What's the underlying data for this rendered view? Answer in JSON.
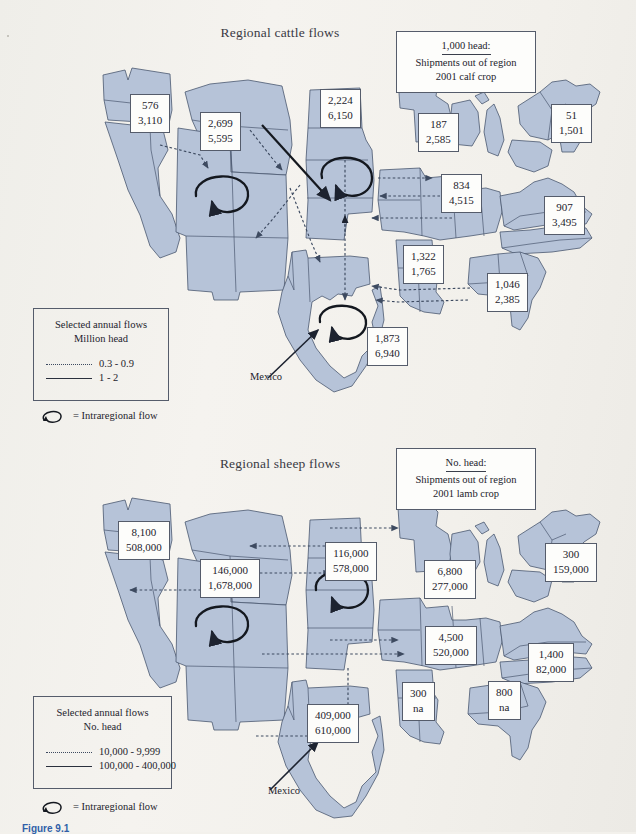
{
  "figure": {
    "caption": "Figure 9.1",
    "background_color": "#f2f0eb",
    "region_fill_color": "#b6c3d8",
    "region_stroke_color": "#4a5870"
  },
  "cattle_map": {
    "title": "Regional cattle flows",
    "note": {
      "head_line": "1,000 head:",
      "line2": "Shipments out of region",
      "line3": "2001 calf crop"
    },
    "mexico_label": "Mexico",
    "legend": {
      "title_line1": "Selected annual flows",
      "title_line2": "Million head",
      "rows": [
        {
          "style": "dotted",
          "label": "0.3 - 0.9"
        },
        {
          "style": "solid",
          "label": "1 - 2"
        }
      ],
      "intraregional_label": "= Intraregional flow"
    },
    "labels": [
      {
        "region": "pacific-northwest",
        "v1": "576",
        "v2": "3,110"
      },
      {
        "region": "northern-rockies",
        "v1": "2,699",
        "v2": "5,595"
      },
      {
        "region": "northern-plains",
        "v1": "2,224",
        "v2": "6,150"
      },
      {
        "region": "upper-midwest",
        "v1": "187",
        "v2": "2,585"
      },
      {
        "region": "northeast",
        "v1": "51",
        "v2": "1,501"
      },
      {
        "region": "corn-belt",
        "v1": "834",
        "v2": "4,515"
      },
      {
        "region": "appalachia",
        "v1": "907",
        "v2": "3,495"
      },
      {
        "region": "delta-states",
        "v1": "1,322",
        "v2": "1,765"
      },
      {
        "region": "southeast",
        "v1": "1,046",
        "v2": "2,385"
      },
      {
        "region": "southern-plains",
        "v1": "1,873",
        "v2": "6,940"
      }
    ]
  },
  "sheep_map": {
    "title": "Regional sheep flows",
    "note": {
      "head_line": "No. head:",
      "line2": "Shipments out of region",
      "line3": "2001 lamb crop"
    },
    "mexico_label": "Mexico",
    "legend": {
      "title_line1": "Selected annual flows",
      "title_line2": "No. head",
      "rows": [
        {
          "style": "dotted",
          "label": "10,000 - 9,999"
        },
        {
          "style": "solid",
          "label": "100,000 - 400,000"
        }
      ],
      "intraregional_label": "= Intraregional flow"
    },
    "labels": [
      {
        "region": "pacific-northwest",
        "v1": "8,100",
        "v2": "508,000"
      },
      {
        "region": "northern-rockies",
        "v1": "146,000",
        "v2": "1,678,000"
      },
      {
        "region": "northern-plains",
        "v1": "116,000",
        "v2": "578,000"
      },
      {
        "region": "upper-midwest",
        "v1": "6,800",
        "v2": "277,000"
      },
      {
        "region": "northeast",
        "v1": "300",
        "v2": "159,000"
      },
      {
        "region": "corn-belt",
        "v1": "4,500",
        "v2": "520,000"
      },
      {
        "region": "appalachia",
        "v1": "1,400",
        "v2": "82,000"
      },
      {
        "region": "delta-states",
        "v1": "300",
        "v2": "na"
      },
      {
        "region": "southeast",
        "v1": "800",
        "v2": "na"
      },
      {
        "region": "southern-plains",
        "v1": "409,000",
        "v2": "610,000"
      }
    ]
  }
}
